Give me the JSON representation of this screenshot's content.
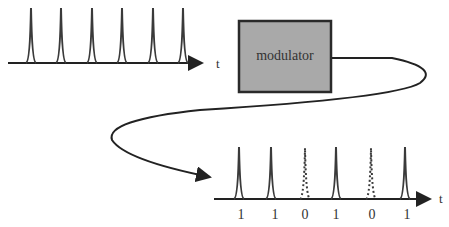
{
  "diagram": {
    "modulator_label": "modulator",
    "input_axis_label": "t",
    "output_axis_label": "t",
    "input_pulse_count": 6,
    "output_bits": [
      "1",
      "1",
      "0",
      "1",
      "0",
      "1"
    ],
    "colors": {
      "pulse": "#3a3a3a",
      "box_fill": "#a9a9a9",
      "box_stroke": "#2a2a2a",
      "line": "#222222"
    }
  }
}
